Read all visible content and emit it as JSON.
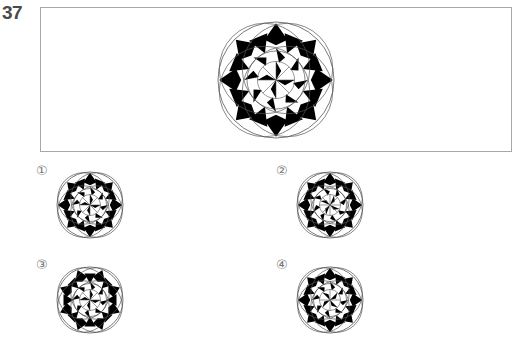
{
  "question": {
    "number": "37",
    "figure": {
      "name": "mandala-pattern",
      "variant": "main",
      "cx": 276,
      "cy": 80,
      "r": 58
    }
  },
  "options": [
    {
      "label": "①",
      "variant": "opt1",
      "label_x": 36,
      "label_y": 163,
      "cx": 90,
      "cy": 205,
      "r": 33
    },
    {
      "label": "②",
      "variant": "opt2",
      "label_x": 276,
      "label_y": 163,
      "cx": 330,
      "cy": 205,
      "r": 33
    },
    {
      "label": "③",
      "variant": "opt3",
      "label_x": 36,
      "label_y": 257,
      "cx": 90,
      "cy": 300,
      "r": 33
    },
    {
      "label": "④",
      "variant": "opt4",
      "label_x": 276,
      "label_y": 257,
      "cx": 330,
      "cy": 300,
      "r": 33
    }
  ],
  "colors": {
    "ink": "#000000",
    "paper": "#ffffff",
    "line": "#555555",
    "border": "#a8a8a8",
    "label": "#4a4a4a"
  }
}
